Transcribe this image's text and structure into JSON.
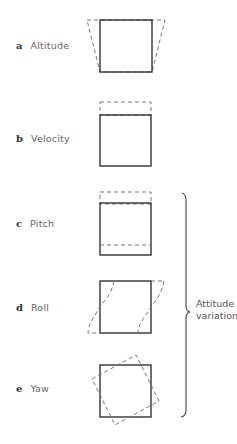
{
  "diagram": {
    "panels": [
      {
        "letter": "a",
        "label": "Altitude",
        "variation": "trapezoid-widened-top"
      },
      {
        "letter": "b",
        "label": "Velocity",
        "variation": "dashed-extension-top"
      },
      {
        "letter": "c",
        "label": "Pitch",
        "variation": "dashed-shift-vertical"
      },
      {
        "letter": "d",
        "label": "Roll",
        "variation": "curved-skew-sides"
      },
      {
        "letter": "e",
        "label": "Yaw",
        "variation": "rotated-square"
      }
    ],
    "brace": {
      "label_line1": "Attitude",
      "label_line2": "variations",
      "spans": [
        "c",
        "d",
        "e"
      ]
    },
    "colors": {
      "solid_line": "#333333",
      "dashed_line": "#777777",
      "text": "#555555"
    }
  }
}
